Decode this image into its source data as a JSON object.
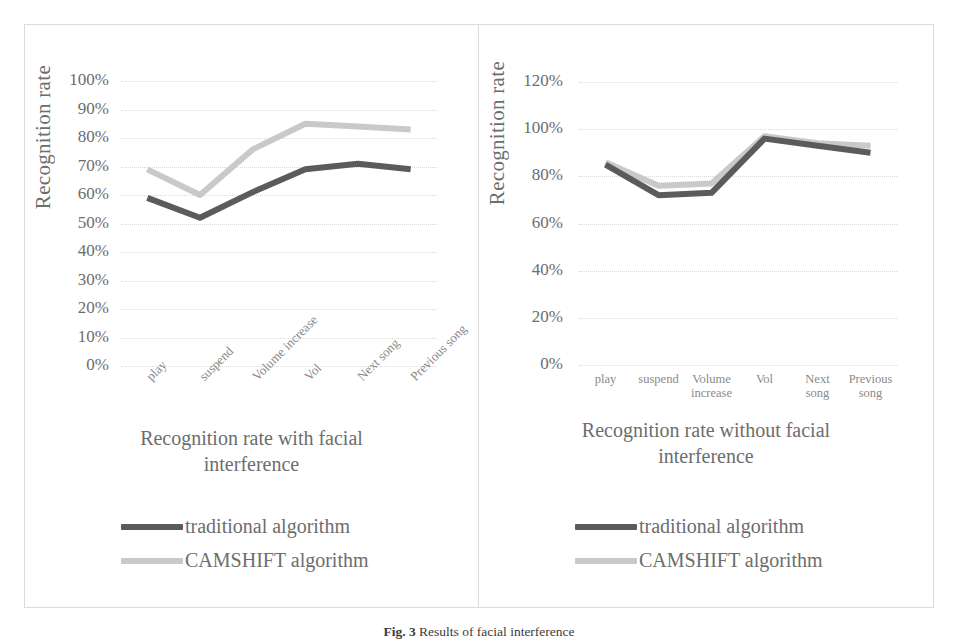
{
  "figure": {
    "caption_prefix": "Fig. 3",
    "caption_text": "Results of facial interference"
  },
  "series_colors": {
    "traditional": "#5b5b5b",
    "camshift": "#c9c9c9"
  },
  "legend": {
    "traditional_label": "traditional algorithm",
    "camshift_label": "CAMSHIFT algorithm"
  },
  "left_panel": {
    "y_axis_title": "Recognition rate",
    "axis_title_line1": "Recognition rate with facial",
    "axis_title_line2": "interference"
  },
  "right_panel": {
    "y_axis_title": "Recognition rate",
    "axis_title_line1": "Recognition rate without facial",
    "axis_title_line2": "interference"
  },
  "chart_data": [
    {
      "type": "line",
      "title": "Recognition rate with facial interference",
      "xlabel": "",
      "ylabel": "Recognition rate",
      "categories": [
        "play",
        "suspend",
        "Volume increase",
        "Vol",
        "Next song",
        "Previous song"
      ],
      "ylim": [
        0,
        100
      ],
      "yticks": [
        "0%",
        "10%",
        "20%",
        "30%",
        "40%",
        "50%",
        "60%",
        "70%",
        "80%",
        "90%",
        "100%"
      ],
      "ytick_values": [
        0,
        10,
        20,
        30,
        40,
        50,
        60,
        70,
        80,
        90,
        100
      ],
      "grid": true,
      "legend_position": "below",
      "xtick_rotation": -45,
      "series": [
        {
          "name": "traditional algorithm",
          "color": "#5b5b5b",
          "values": [
            59,
            52,
            61,
            69,
            71,
            69
          ]
        },
        {
          "name": "CAMSHIFT algorithm",
          "color": "#c9c9c9",
          "values": [
            69,
            60,
            76,
            85,
            84,
            83
          ]
        }
      ]
    },
    {
      "type": "line",
      "title": "Recognition rate without facial interference",
      "xlabel": "",
      "ylabel": "Recognition rate",
      "categories": [
        "play",
        "suspend",
        "Volume increase",
        "Vol",
        "Next song",
        "Previous song"
      ],
      "ylim": [
        0,
        120
      ],
      "yticks": [
        "0%",
        "20%",
        "40%",
        "60%",
        "80%",
        "100%",
        "120%"
      ],
      "ytick_values": [
        0,
        20,
        40,
        60,
        80,
        100,
        120
      ],
      "grid": true,
      "legend_position": "below",
      "xtick_rotation": 0,
      "series": [
        {
          "name": "traditional algorithm",
          "color": "#5b5b5b",
          "values": [
            85,
            72,
            73,
            96,
            93,
            90
          ]
        },
        {
          "name": "CAMSHIFT algorithm",
          "color": "#c9c9c9",
          "values": [
            86,
            76,
            77,
            97,
            94,
            93
          ]
        }
      ]
    }
  ],
  "right_xtick_lines": [
    [
      "play",
      ""
    ],
    [
      "suspend",
      ""
    ],
    [
      "Volume",
      "increase"
    ],
    [
      "Vol",
      ""
    ],
    [
      "Next",
      "song"
    ],
    [
      "Previous",
      "song"
    ]
  ]
}
